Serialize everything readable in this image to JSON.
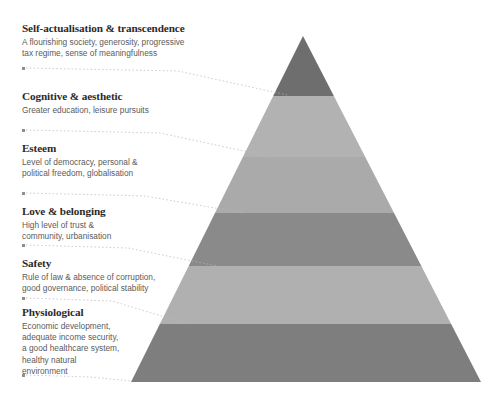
{
  "diagram": {
    "background_color": "#ffffff"
  },
  "levels": [
    {
      "id": "self-actualisation",
      "title": "Self-actualisation & transcendence",
      "description": "A flourishing society, generosity, progressive\ntax regime, sense of meaningfulness",
      "band_color": "#6e6e6e",
      "order": 6
    },
    {
      "id": "cognitive-aesthetic",
      "title": "Cognitive & aesthetic",
      "description": "Greater education, leisure pursuits",
      "band_color": "#b2b2b2",
      "order": 5
    },
    {
      "id": "esteem",
      "title": "Esteem",
      "description": "Level of democracy, personal &\npolitical freedom, globalisation",
      "band_color": "#aaaaaa",
      "order": 4
    },
    {
      "id": "love-belonging",
      "title": "Love & belonging",
      "description": "High level of trust &\ncommunity, urbanisation",
      "band_color": "#8a8a8a",
      "order": 3
    },
    {
      "id": "safety",
      "title": "Safety",
      "description": "Rule of law & absence of corruption,\ngood governance, political stability",
      "band_color": "#b0b0b0",
      "order": 2
    },
    {
      "id": "physiological",
      "title": "Physiological",
      "description": "Economic development,\nadequate income security,\na good healthcare system,\nhealthy natural\nenvironment",
      "band_color": "#7e7e7e",
      "order": 1
    }
  ],
  "colors": {
    "text_heading": "#2b2b2b",
    "text_body": "#5b5b5b",
    "leader_line": "#b9b9b9",
    "bullet": "#8f8f8f"
  }
}
